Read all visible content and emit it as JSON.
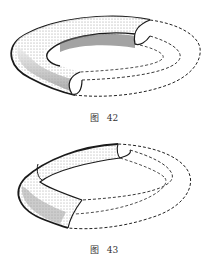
{
  "figures": [
    {
      "id": "fig42",
      "caption_prefix": "图",
      "caption_number": "42",
      "description": "Torus with a cut-open half-shell section"
    },
    {
      "id": "fig43",
      "caption_prefix": "图",
      "caption_number": "43",
      "description": "Torus ring with a band-like surface strip"
    }
  ],
  "colors": {
    "ink": "#1a1a1a",
    "shade": "#6a6a6a",
    "paper": "#ffffff"
  }
}
